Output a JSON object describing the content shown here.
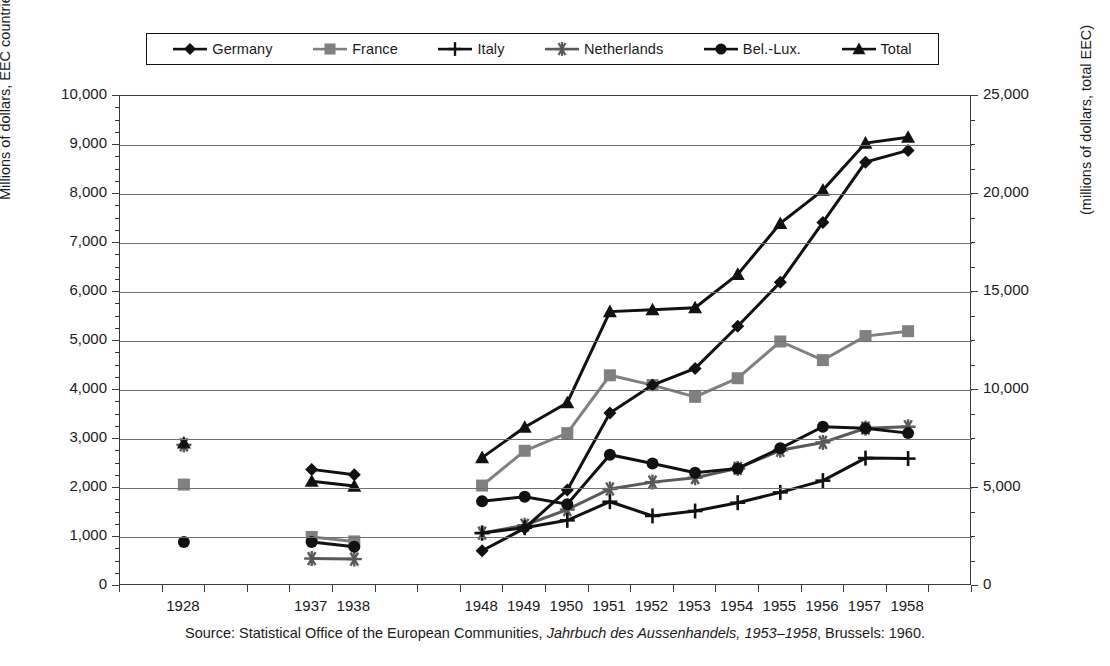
{
  "legend": {
    "items": [
      {
        "label": "Germany",
        "marker": "diamond",
        "color": "#111111"
      },
      {
        "label": "France",
        "marker": "square",
        "color": "#808080"
      },
      {
        "label": "Italy",
        "marker": "plus",
        "color": "#111111"
      },
      {
        "label": "Netherlands",
        "marker": "asterisk",
        "color": "#595959"
      },
      {
        "label": "Bel.-Lux.",
        "marker": "circle",
        "color": "#111111"
      },
      {
        "label": "Total",
        "marker": "triangle",
        "color": "#111111"
      }
    ]
  },
  "axes": {
    "left_title": "Millions of dollars, EEC countries",
    "right_title": "(millions of dollars, total EEC)",
    "left_ticks": [
      "10,000",
      "9,000",
      "8,000",
      "7,000",
      "6,000",
      "5,000",
      "4,000",
      "3,000",
      "2,000",
      "1,000",
      "0"
    ],
    "right_ticks": [
      "25,000",
      "20,000",
      "15,000",
      "10,000",
      "5,000",
      "0"
    ]
  },
  "source": {
    "prefix": "Source: Statistical Office of the European Communities, ",
    "italic": "Jahrbuch des Aussenhandels, 1953–1958",
    "suffix": ", Brussels: 1960."
  },
  "chart_data": {
    "type": "line",
    "title": "",
    "xlabel": "",
    "ylabel": "Millions of dollars, EEC countries",
    "ylabel_right": "(millions of dollars, total EEC)",
    "ylim": [
      0,
      10000
    ],
    "ylim_right": [
      0,
      25000
    ],
    "grid": true,
    "legend_position": "top",
    "categories": [
      "1928",
      "1937",
      "1938",
      "1948",
      "1949",
      "1950",
      "1951",
      "1952",
      "1953",
      "1954",
      "1955",
      "1956",
      "1957",
      "1958"
    ],
    "slots": [
      1,
      4,
      5,
      8,
      9,
      10,
      11,
      12,
      13,
      14,
      15,
      16,
      17,
      18
    ],
    "n_slots": 20,
    "series": [
      {
        "name": "Germany",
        "axis": "left",
        "marker": "diamond",
        "color": "#111111",
        "values": [
          null,
          2380,
          2270,
          720,
          1180,
          1960,
          3530,
          4100,
          4440,
          5300,
          6200,
          7420,
          8650,
          8890
        ]
      },
      {
        "name": "France",
        "axis": "left",
        "marker": "square",
        "color": "#808080",
        "values": [
          2070,
          1000,
          910,
          2050,
          2760,
          3120,
          4300,
          4100,
          3860,
          4240,
          4990,
          4610,
          5100,
          5200
        ]
      },
      {
        "name": "Italy",
        "axis": "left",
        "marker": "plus",
        "color": "#111111",
        "values": [
          null,
          null,
          null,
          1080,
          1190,
          1340,
          1720,
          1430,
          1530,
          1700,
          1910,
          2150,
          2610,
          2600
        ]
      },
      {
        "name": "Netherlands",
        "axis": "left",
        "marker": "asterisk",
        "color": "#595959",
        "values": [
          2880,
          560,
          550,
          1080,
          1240,
          1560,
          1980,
          2120,
          2210,
          2400,
          2770,
          2930,
          3220,
          3250
        ]
      },
      {
        "name": "Bel.-Lux.",
        "axis": "left",
        "marker": "circle",
        "color": "#111111",
        "values": [
          900,
          900,
          800,
          1730,
          1820,
          1670,
          2680,
          2500,
          2310,
          2400,
          2810,
          3250,
          3220,
          3120
        ]
      },
      {
        "name": "Total",
        "axis": "right",
        "marker": "triangle",
        "color": "#111111",
        "values": [
          7300,
          5350,
          5100,
          6550,
          8100,
          9350,
          14000,
          14100,
          14200,
          15900,
          18500,
          20200,
          22600,
          22900
        ]
      }
    ]
  }
}
